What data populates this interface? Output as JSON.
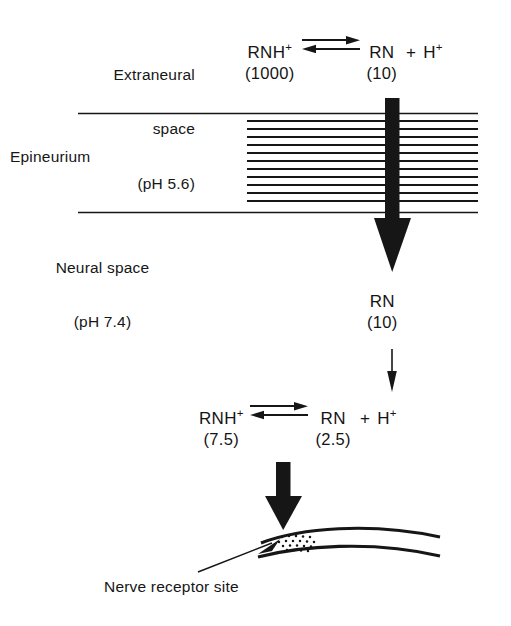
{
  "figure": {
    "type": "diagram"
  },
  "regions": {
    "extraneural": {
      "name": "Extraneural",
      "line1": "Extraneural",
      "line2": "space",
      "ph": "(pH 5.6)",
      "ph_value": "5.6"
    },
    "epineurium": {
      "label": "Epineurium"
    },
    "neural": {
      "line1": "Neural space",
      "ph": "(pH 7.4)",
      "ph_value": "7.4"
    }
  },
  "equations": {
    "top": {
      "left_formula": "RNH",
      "left_charge": "+",
      "left_count": "(1000)",
      "right_formula": "RN",
      "right_count": "(10)",
      "plus": "+",
      "proton_formula": "H",
      "proton_charge": "+",
      "arrow_type": "equilibrium-double-arrow"
    },
    "bottom": {
      "left_formula": "RNH",
      "left_charge": "+",
      "left_count": "(7.5)",
      "right_formula": "RN",
      "right_count": "(2.5)",
      "plus": "+",
      "proton_formula": "H",
      "proton_charge": "+",
      "arrow_type": "equilibrium-double-arrow"
    }
  },
  "middle_species": {
    "formula": "RN",
    "count": "(10)"
  },
  "caption": {
    "receptor_site": "Nerve receptor site"
  },
  "colors": {
    "ink": "#161616",
    "background": "#ffffff"
  }
}
